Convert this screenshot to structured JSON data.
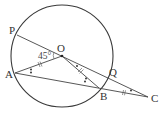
{
  "diagram": {
    "type": "geometry-circle",
    "circle": {
      "center_label": "O",
      "cx": 62,
      "cy": 56,
      "r": 51
    },
    "points": {
      "P": {
        "label": "P",
        "x": 17,
        "y": 35
      },
      "O": {
        "label": "O",
        "x": 62,
        "y": 56
      },
      "A": {
        "label": "A",
        "x": 15,
        "y": 73
      },
      "B": {
        "label": "B",
        "x": 99,
        "y": 88
      },
      "Q": {
        "label": "Q",
        "x": 107,
        "y": 76
      },
      "C": {
        "label": "C",
        "x": 148,
        "y": 97
      }
    },
    "segments": [
      "P-C",
      "A-O",
      "O-B",
      "A-C"
    ],
    "angle_label": "45°",
    "angle_marked": "AOP",
    "equal_marks": [
      "OA",
      "OB",
      "BC"
    ],
    "colors": {
      "line": "#444444",
      "text": "#333333"
    }
  }
}
